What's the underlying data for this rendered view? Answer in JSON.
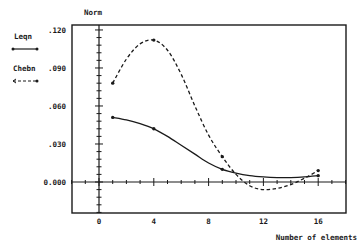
{
  "chart_data": {
    "type": "line",
    "title": "",
    "ylabel": "Norm",
    "xlabel": "Number of elements",
    "xlim": [
      -2,
      18
    ],
    "ylim": [
      -0.024,
      0.124
    ],
    "x_ticks": [
      0,
      4,
      8,
      12,
      16
    ],
    "x_tick_labels": [
      "0",
      "4",
      "8",
      "12",
      "16"
    ],
    "y_ticks": [
      0.0,
      0.03,
      0.06,
      0.09,
      0.12
    ],
    "y_tick_labels": [
      "0.000",
      ".030",
      ".060",
      ".090",
      ".120"
    ],
    "grid": false,
    "legend_position": "left-outside",
    "series": [
      {
        "name": "Leqn",
        "style": "solid",
        "markers_x": [
          1,
          4,
          9,
          16
        ],
        "markers_y": [
          0.051,
          0.042,
          0.01,
          0.005
        ],
        "curve_x": [
          1,
          2,
          3,
          4,
          5,
          6,
          7,
          8,
          9,
          10,
          11,
          12,
          13,
          14,
          15,
          16
        ],
        "curve_y": [
          0.051,
          0.049,
          0.046,
          0.042,
          0.036,
          0.029,
          0.022,
          0.015,
          0.01,
          0.007,
          0.005,
          0.004,
          0.0035,
          0.0035,
          0.004,
          0.005
        ]
      },
      {
        "name": "Chebn",
        "style": "dashed",
        "markers_x": [
          1,
          4,
          9,
          16
        ],
        "markers_y": [
          0.078,
          0.112,
          0.02,
          0.009
        ],
        "curve_x": [
          1,
          2,
          3,
          4,
          5,
          6,
          7,
          8,
          9,
          10,
          11,
          12,
          13,
          14,
          15,
          16
        ],
        "curve_y": [
          0.078,
          0.097,
          0.109,
          0.112,
          0.104,
          0.085,
          0.06,
          0.037,
          0.02,
          0.006,
          -0.003,
          -0.006,
          -0.005,
          -0.002,
          0.003,
          0.009
        ]
      }
    ]
  },
  "legend": [
    {
      "label": "Leqn",
      "style": "solid"
    },
    {
      "label": "Chebn",
      "style": "dashed"
    }
  ],
  "axes": {
    "y_title": "Norm",
    "x_title": "Number of elements"
  },
  "colors": {
    "ink": "#1a1a1a",
    "background": "#ffffff"
  }
}
